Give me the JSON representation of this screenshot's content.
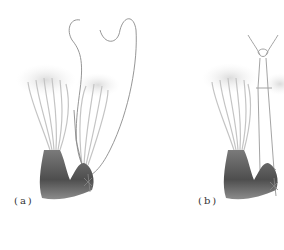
{
  "figure": {
    "panels": [
      {
        "id": "a",
        "label": "(a)",
        "description": "Papillary muscles with chordae tendineae and leaflet tissue; long suture loops extending above"
      },
      {
        "id": "b",
        "label": "(b)",
        "description": "Papillary muscles with chordae tendineae; suture loops tied into a rectangular frame with knot at top"
      }
    ],
    "colors": {
      "background": "#ffffff",
      "muscle_dark": "#5a5a5a",
      "leaflet_light": "#e2e2e2",
      "chordae": "#c8c8c8",
      "suture": "#8a8a8a"
    }
  }
}
